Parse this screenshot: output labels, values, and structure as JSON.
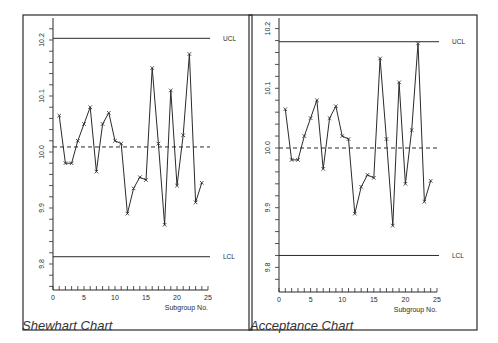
{
  "chart_data": [
    {
      "type": "line",
      "title": "Shewhart Chart",
      "xlabel": "Subgroup No.",
      "ylabel": "",
      "xlim": [
        0,
        25
      ],
      "ylim": [
        9.75,
        10.23
      ],
      "x_ticks": [
        0,
        5,
        10,
        15,
        20,
        25
      ],
      "y_ticks": [
        "9.8",
        "9.9",
        "10.0",
        "10.1",
        "10.2"
      ],
      "grid": false,
      "x": [
        1,
        2,
        3,
        4,
        5,
        6,
        7,
        8,
        9,
        10,
        11,
        12,
        13,
        14,
        15,
        16,
        17,
        18,
        19,
        20,
        21,
        22,
        23,
        24
      ],
      "values": [
        10.065,
        9.98,
        9.98,
        10.02,
        10.05,
        10.08,
        9.965,
        10.05,
        10.07,
        10.02,
        10.015,
        9.89,
        9.935,
        9.955,
        9.95,
        10.15,
        10.015,
        9.87,
        10.11,
        9.94,
        10.03,
        10.175,
        9.91,
        9.945
      ],
      "marker": "x",
      "reference_lines": [
        {
          "name": "UCL",
          "value": 10.203,
          "style": "solid",
          "label": "UCL"
        },
        {
          "name": "center",
          "value": 10.009,
          "style": "dashed",
          "label": ""
        },
        {
          "name": "LCL",
          "value": 9.813,
          "style": "solid",
          "label": "LCL"
        }
      ]
    },
    {
      "type": "line",
      "title": "Acceptance Chart",
      "xlabel": "Subgroup No.",
      "ylabel": "",
      "xlim": [
        0,
        25
      ],
      "ylim": [
        9.73,
        10.23
      ],
      "x_ticks": [
        0,
        5,
        10,
        15,
        20,
        25
      ],
      "y_ticks": [
        "9.8",
        "9.9",
        "10.0",
        "10.1",
        "10.2"
      ],
      "grid": false,
      "x": [
        1,
        2,
        3,
        4,
        5,
        6,
        7,
        8,
        9,
        10,
        11,
        12,
        13,
        14,
        15,
        16,
        17,
        18,
        19,
        20,
        21,
        22,
        23,
        24
      ],
      "values": [
        10.065,
        9.98,
        9.98,
        10.02,
        10.05,
        10.08,
        9.965,
        10.05,
        10.07,
        10.02,
        10.015,
        9.89,
        9.935,
        9.955,
        9.95,
        10.15,
        10.015,
        9.87,
        10.11,
        9.94,
        10.03,
        10.175,
        9.91,
        9.945
      ],
      "marker": "x",
      "reference_lines": [
        {
          "name": "UCL",
          "value": 10.178,
          "style": "solid",
          "label": "UCL"
        },
        {
          "name": "center",
          "value": 10.0,
          "style": "dashed",
          "label": ""
        },
        {
          "name": "LCL",
          "value": 9.82,
          "style": "solid",
          "label": "LCL"
        }
      ]
    }
  ],
  "captions": {
    "left": "Shewhart Chart",
    "right": "Acceptance Chart"
  },
  "layout": {
    "charts": [
      {
        "frame": [
          23,
          15,
          252,
          330
        ],
        "x0": 53,
        "x25": 208,
        "yBottom": 290,
        "yTopAxis": 18,
        "v_ref": 10.0,
        "y_ref": 152,
        "px_per_tenth": 56,
        "label_right_x": 223
      },
      {
        "frame": [
          249,
          15,
          477,
          330
        ],
        "x0": 279,
        "x25": 437,
        "yBottom": 292,
        "yTopAxis": 18,
        "v_ref": 10.0,
        "y_ref": 148,
        "px_per_tenth": 59.7,
        "label_right_x": 452
      }
    ],
    "line_color": "#2a2a2a"
  }
}
